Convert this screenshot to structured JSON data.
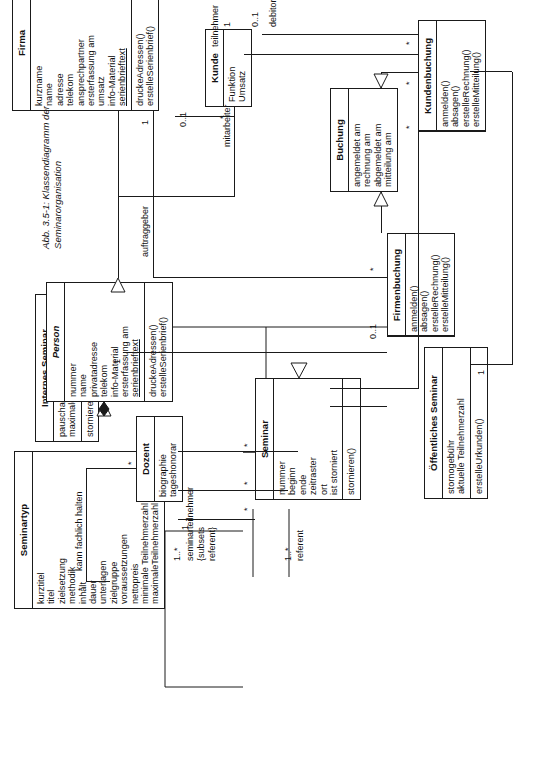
{
  "figure": {
    "caption_line1": "Abb. 3.5-1: Klassendiagramm der",
    "caption_line2": "Seminarorganisation",
    "orientation": "rotated-90"
  },
  "classes": {
    "seminartyp": {
      "name": "Seminartyp",
      "abstract": false,
      "attributes": [
        "kurztitel",
        "titel",
        "zielsetzung",
        "methodik",
        "inhalt",
        "dauer",
        "unterlagen",
        "zielgruppe",
        "voraussetzungen",
        "nettopreis",
        "minimale Teilnehmerzahl",
        "maximaleTeilnehmerzahl"
      ],
      "operations": []
    },
    "seminar": {
      "name": "Seminar",
      "abstract": false,
      "attributes": [
        "nummer",
        "beginn",
        "ende",
        "zeitraster",
        "ort",
        "ist storniert"
      ],
      "operations": [
        "stornieren()"
      ]
    },
    "internes_seminar": {
      "name": "Internes Seminar",
      "abstract": false,
      "attributes": [
        "pauschalpreis",
        "maximale Teilnehmerzahl"
      ],
      "operations": [
        "stornieren"
      ]
    },
    "oeffentliches_seminar": {
      "name": "Öffentliches Seminar",
      "abstract": false,
      "attributes": [
        "stornogebühr",
        "aktuelle Teilnehmerzahl"
      ],
      "operations": [
        "erstelleUrkunden()"
      ]
    },
    "dozent": {
      "name": "Dozent",
      "abstract": false,
      "attributes": [
        "biographie",
        "tageshonorar"
      ],
      "operations": []
    },
    "person": {
      "name": "Person",
      "abstract": true,
      "attributes": [
        "nummer",
        "name",
        "privatadresse",
        "telekom",
        "info-Material",
        "ersterfassung am",
        "serienbrieftext"
      ],
      "operations": [
        "druckeAdressen()",
        "erstelleSerienbrief()"
      ]
    },
    "firma": {
      "name": "Firma",
      "abstract": false,
      "attributes": [
        "kurzname",
        "name",
        "adresse",
        "telekom",
        "ansprechpartner",
        "ersterfassung am",
        "umsatz",
        "info-Material",
        "serienbrieftext"
      ],
      "operations": [
        "druckeAdressen()",
        "erstelleSerienbrief()"
      ]
    },
    "kunde": {
      "name": "Kunde",
      "abstract": false,
      "attributes": [
        "Funktion",
        "Umsatz"
      ],
      "operations": []
    },
    "buchung": {
      "name": "Buchung",
      "abstract": false,
      "attributes": [
        "angemeldet am",
        "rechnung am",
        "abgemeldet am",
        "mitteilung am"
      ],
      "operations": []
    },
    "firmenbuchung": {
      "name": "Firmenbuchung",
      "abstract": false,
      "attributes": [],
      "operations": [
        "anmelden()",
        "absagen()",
        "erstelleRechnung()",
        "erstelleMitteilung()"
      ]
    },
    "kundenbuchung": {
      "name": "Kundenbuchung",
      "abstract": false,
      "attributes": [],
      "operations": [
        "anmelden()",
        "absagen()",
        "erstelleRechnung()",
        "erstelleMitteilung()"
      ]
    }
  },
  "associations": {
    "kann_fachlich_halten": "kann fachlich halten",
    "seminarteilnehmer": "seminarteilnehmer",
    "subsets": "{subsets",
    "subsets_ref": "referent}",
    "referent": "referent",
    "auftraggeber": "auftraggeber",
    "mitarbeiter": "mitarbeiter",
    "teilnehmer": "teilnehmer",
    "debitor": "debitor"
  },
  "multiplicities": {
    "dozent_star": "*",
    "seminartyp_star": "*",
    "seminartyp_one": "1",
    "seminar_star_a": "*",
    "seminar_star_b": "*",
    "seminar_star_c": "*",
    "dozent_one_star_a": "1..*",
    "dozent_one_star_b": "1..*",
    "internes_one": "1",
    "oeffentliches_one": "1",
    "firmenbuchung_zero_one": "0..1",
    "firmenbuchung_star": "*",
    "kundenbuchung_star_a": "*",
    "kundenbuchung_star_b": "*",
    "kundenbuchung_star_c": "*",
    "firma_zero_one": "0..1",
    "firma_one": "1",
    "kunde_star": "*",
    "kunde_one": "1",
    "kunde_zero_one": "0..1"
  }
}
